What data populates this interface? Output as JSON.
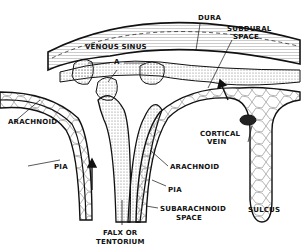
{
  "figure": {
    "type": "anatomical cross-section diagram",
    "labels": {
      "dura": "DURA",
      "venous_sinus": "VENOUS SINUS",
      "subdural_space_1": "SUBDURAL",
      "subdural_space_2": "SPACE",
      "a_marker": "A",
      "arachnoid_left": "ARACHNOID",
      "cortical_vein_1": "CORTICAL",
      "cortical_vein_2": "VEIN",
      "pia_left": "PIA",
      "arachnoid_right": "ARACHNOID",
      "pia_right": "PIA",
      "subarachnoid_space_1": "SUBARACHNOID",
      "subarachnoid_space_2": "SPACE",
      "sulcus": "SULCUS",
      "falx_1": "FALX OR",
      "falx_2": "TENTORIUM"
    },
    "colors": {
      "ink": "#111111",
      "background": "#ffffff",
      "stipple": "#8a8a8a"
    }
  }
}
